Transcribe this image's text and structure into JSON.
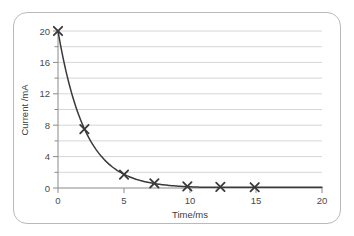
{
  "chart_data": {
    "type": "line",
    "title": "",
    "xlabel": "Time/ms",
    "ylabel": "Current /mA",
    "xlim": [
      0,
      20
    ],
    "ylim": [
      0,
      20
    ],
    "grid": true,
    "grid_axis": "y",
    "legend": "none",
    "marker": "x",
    "line_color": "#3a3a3a",
    "grid_color": "#d6d6d6",
    "axis_color": "#8a8a8a",
    "text_color": "#4a4a4a",
    "xticks": [
      0,
      5,
      10,
      15,
      20
    ],
    "xtick_labels": [
      "0",
      "5",
      "10",
      "15",
      "20"
    ],
    "yticks": [
      0,
      4,
      8,
      12,
      16,
      20
    ],
    "ytick_labels": [
      "0",
      "4",
      "8",
      "12",
      "16",
      "20"
    ],
    "y_minor_ticks": [
      2,
      6,
      10,
      14,
      18
    ],
    "gridlines_y": [
      2,
      4,
      6,
      8,
      10,
      12,
      14,
      16,
      18,
      20
    ],
    "series": [
      {
        "name": "Discharge current",
        "x": [
          0,
          2,
          5,
          7.3,
          9.8,
          12.3,
          14.9
        ],
        "y": [
          20,
          7.5,
          1.7,
          0.6,
          0.2,
          0.15,
          0.1
        ]
      }
    ],
    "fit_curve": {
      "description": "exponential decay through plotted points",
      "I0": 20,
      "tau": 2.05
    }
  }
}
